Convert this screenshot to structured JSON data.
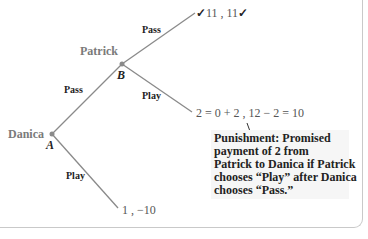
{
  "diagram": {
    "type": "game-tree",
    "players": {
      "first": "Danica",
      "second": "Patrick"
    },
    "nodes": {
      "A": {
        "label": "A",
        "player": "Danica"
      },
      "B": {
        "label": "B",
        "player": "Patrick"
      }
    },
    "branches": {
      "a_pass": "Pass",
      "a_play": "Play",
      "b_pass": "Pass",
      "b_play": "Play"
    },
    "payoffs": {
      "pass_pass": {
        "check_left": "✓",
        "text": "11 , 11",
        "check_right": "✓"
      },
      "pass_play": "2 = 0 + 2 , 12 − 2 = 10",
      "play": "1 , −10"
    },
    "annotation": {
      "lines": [
        "Punishment: Promised",
        "payment of 2 from",
        "Patrick to Danica if Patrick",
        "chooses “Play” after Danica",
        "chooses “Pass.”"
      ]
    },
    "colors": {
      "line": "#8a8a8a",
      "node_dot": "#8a8a8a",
      "player_label": "#7a7a7a",
      "annotation_bg": "#f6f6f6",
      "frame": "#c9c9c9"
    }
  }
}
